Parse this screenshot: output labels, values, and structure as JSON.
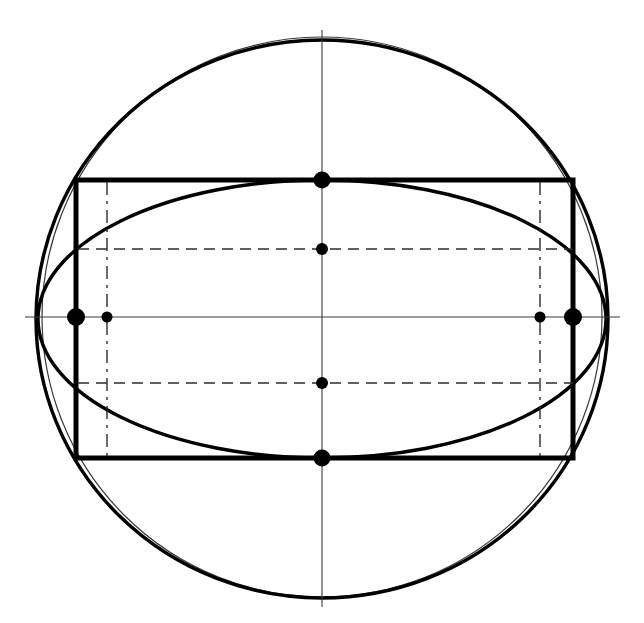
{
  "figure": {
    "canvas": {
      "width": 644,
      "height": 623,
      "background": "#ffffff"
    },
    "colors": {
      "stroke_heavy": "#000000",
      "stroke_light": "#3a3a3a",
      "stroke_dashed": "#2b2b2b",
      "marker_fill": "#000000",
      "background": "#ffffff"
    },
    "center": {
      "x": 322,
      "y": 317
    }
  },
  "chart_data": {
    "type": "scatter",
    "xlabel": "",
    "ylabel": "",
    "xlim": [
      0,
      644
    ],
    "ylim": [
      0,
      623
    ],
    "grid": false,
    "legend": "none",
    "shapes": [
      {
        "name": "outer-thin-circle",
        "kind": "circle",
        "cx": 322,
        "cy": 317,
        "r": 280,
        "stroke": "#3a3a3a",
        "stroke_width": 1.2,
        "dash": "none"
      },
      {
        "name": "tall-heavy-ellipse",
        "kind": "ellipse",
        "cx": 322,
        "cy": 319,
        "rx": 286,
        "ry": 279,
        "stroke": "#000000",
        "stroke_width": 3.4,
        "dash": "none"
      },
      {
        "name": "flat-heavy-ellipse",
        "kind": "ellipse",
        "cx": 322,
        "cy": 319,
        "rx": 284,
        "ry": 139,
        "stroke": "#000000",
        "stroke_width": 3.4,
        "dash": "none"
      },
      {
        "name": "inscribed-rectangle",
        "kind": "rect",
        "x": 76,
        "y": 180,
        "width": 497,
        "height": 278,
        "stroke": "#000000",
        "stroke_width": 5.0,
        "dash": "none"
      }
    ],
    "axes_lines": [
      {
        "name": "horizontal-center-axis",
        "x1": 25,
        "y1": 317,
        "x2": 620,
        "y2": 317,
        "stroke": "#3a3a3a",
        "stroke_width": 1.1,
        "dash": "none"
      },
      {
        "name": "vertical-center-axis",
        "x1": 322,
        "y1": 30,
        "x2": 322,
        "y2": 607,
        "stroke": "#3a3a3a",
        "stroke_width": 1.1,
        "dash": "none"
      }
    ],
    "dashed_lines": [
      {
        "name": "upper-dashed-chord",
        "x1": 78,
        "y1": 249,
        "x2": 573,
        "y2": 249,
        "stroke": "#2b2b2b",
        "stroke_width": 1.4,
        "dash": "11 7"
      },
      {
        "name": "lower-dashed-chord",
        "x1": 78,
        "y1": 383,
        "x2": 573,
        "y2": 383,
        "stroke": "#2b2b2b",
        "stroke_width": 1.4,
        "dash": "11 7"
      },
      {
        "name": "left-dashdot-vertical",
        "x1": 107,
        "y1": 182,
        "x2": 107,
        "y2": 456,
        "stroke": "#2b2b2b",
        "stroke_width": 1.4,
        "dash": "13 6 3 6"
      },
      {
        "name": "right-dashdot-vertical",
        "x1": 540,
        "y1": 182,
        "x2": 540,
        "y2": 456,
        "stroke": "#2b2b2b",
        "stroke_width": 1.4,
        "dash": "13 6 3 6"
      }
    ],
    "points": [
      {
        "name": "left-vertex-point",
        "x": 76,
        "y": 317,
        "r": 9.0,
        "fill": "#000000"
      },
      {
        "name": "right-vertex-point",
        "x": 573,
        "y": 317,
        "r": 9.0,
        "fill": "#000000"
      },
      {
        "name": "top-midpoint",
        "x": 322,
        "y": 180,
        "r": 8.5,
        "fill": "#000000"
      },
      {
        "name": "bottom-midpoint",
        "x": 322,
        "y": 458,
        "r": 8.5,
        "fill": "#000000"
      },
      {
        "name": "upper-chord-center-point",
        "x": 322,
        "y": 249,
        "r": 6.0,
        "fill": "#000000"
      },
      {
        "name": "lower-chord-center-point",
        "x": 322,
        "y": 383,
        "r": 6.0,
        "fill": "#000000"
      },
      {
        "name": "left-inner-focus-point",
        "x": 107,
        "y": 317,
        "r": 5.5,
        "fill": "#000000"
      },
      {
        "name": "right-inner-focus-point",
        "x": 540,
        "y": 317,
        "r": 5.5,
        "fill": "#000000"
      }
    ]
  }
}
